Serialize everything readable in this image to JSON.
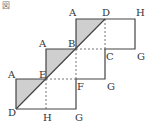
{
  "figure": {
    "title": "図",
    "colors": {
      "stroke": "#444444",
      "shade": "#cfcfcf",
      "background": "#ffffff"
    },
    "labels": {
      "top_A": "A",
      "top_D": "D",
      "top_H": "H",
      "mid_A": "A",
      "mid_B": "B",
      "mid_C": "C",
      "mid_G": "G",
      "bot_A": "A",
      "bot_E": "E",
      "bot_F": "F",
      "bot_G": "G",
      "base_D": "D",
      "base_H": "H",
      "base_G": "G"
    }
  }
}
